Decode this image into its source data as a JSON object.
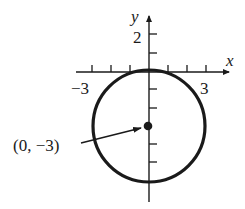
{
  "diagram": {
    "type": "circle-on-coordinate-plane",
    "axes": {
      "x_label": "x",
      "y_label": "y",
      "x_tick_labels": [
        "−3",
        "3"
      ],
      "y_tick_labels": [
        "2"
      ]
    },
    "circle": {
      "center": [
        0,
        -3
      ],
      "radius": 3
    },
    "annotation": {
      "label": "(0, −3)",
      "points_to": "center"
    }
  }
}
